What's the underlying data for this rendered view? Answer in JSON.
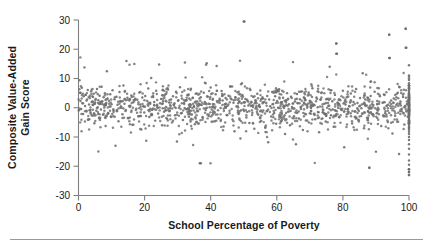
{
  "figure": {
    "background_color": "#ffffff",
    "axis_color": "#808080",
    "text_color": "#1a1a1a",
    "point_color": "#6e6e6e"
  },
  "axes": {
    "ylabel_line1": "Composite Value-Added",
    "ylabel_line2": "Gain Score",
    "xlabel": "School Percentage of Poverty",
    "yticks": [
      "30",
      "20",
      "10",
      "0",
      "-10",
      "-20",
      "-30"
    ],
    "xticks": [
      "0",
      "20",
      "40",
      "60",
      "80",
      "100"
    ]
  },
  "chart_data": {
    "type": "scatter",
    "title": "",
    "xlabel": "School Percentage of Poverty",
    "ylabel": "Composite Value-Added Gain Score",
    "xlim": [
      0,
      100
    ],
    "ylim": [
      -30,
      30
    ],
    "xticks": [
      0,
      20,
      40,
      60,
      80,
      100
    ],
    "yticks": [
      -30,
      -20,
      -10,
      0,
      10,
      20,
      30
    ],
    "grid": false,
    "legend": null,
    "marker": "circle",
    "marker_color": "#6e6e6e",
    "marker_size": 2,
    "n_points": 1400,
    "notable_outliers": [
      {
        "x": 50,
        "y": 29.5
      },
      {
        "x": 99,
        "y": 27
      },
      {
        "x": 94,
        "y": 25
      },
      {
        "x": 78,
        "y": 22
      },
      {
        "x": 99,
        "y": 20.5
      },
      {
        "x": 78,
        "y": 18.5
      },
      {
        "x": 94,
        "y": 17
      },
      {
        "x": 37,
        "y": -19
      },
      {
        "x": 88,
        "y": -20.5
      },
      {
        "x": 100,
        "y": -21
      },
      {
        "x": 100,
        "y": -23
      },
      {
        "x": 100,
        "y": -22
      }
    ],
    "points": [
      [
        0.3,
        9.4
      ],
      [
        0.5,
        5.1
      ],
      [
        0.6,
        2.3
      ],
      [
        0.8,
        -0.4
      ],
      [
        1.0,
        6.8
      ],
      [
        1.2,
        1.5
      ],
      [
        1.4,
        -2.1
      ],
      [
        1.6,
        3.9
      ],
      [
        1.8,
        13.8
      ],
      [
        2.0,
        0.6
      ],
      [
        2.2,
        4.4
      ],
      [
        2.4,
        -1.3
      ],
      [
        2.6,
        2.8
      ],
      [
        2.8,
        6.1
      ],
      [
        3.0,
        -4.0
      ],
      [
        3.2,
        1.1
      ],
      [
        3.4,
        3.3
      ],
      [
        3.6,
        -0.8
      ],
      [
        3.8,
        5.6
      ],
      [
        4.0,
        2.0
      ],
      [
        4.2,
        -2.7
      ],
      [
        4.4,
        0.9
      ],
      [
        4.6,
        4.8
      ],
      [
        4.8,
        -5.3
      ],
      [
        5.0,
        1.8
      ],
      [
        5.2,
        3.0
      ],
      [
        5.4,
        -1.0
      ],
      [
        5.6,
        6.4
      ],
      [
        5.8,
        0.2
      ],
      [
        6.0,
        2.6
      ],
      [
        6.2,
        -3.4
      ],
      [
        6.4,
        4.1
      ],
      [
        6.6,
        1.3
      ],
      [
        6.8,
        -0.6
      ],
      [
        7.0,
        7.2
      ],
      [
        7.2,
        2.2
      ],
      [
        7.4,
        -2.4
      ],
      [
        7.6,
        3.6
      ],
      [
        7.8,
        0.1
      ],
      [
        8.0,
        5.0
      ],
      [
        8.2,
        -6.2
      ],
      [
        8.4,
        1.6
      ],
      [
        8.6,
        12.5
      ],
      [
        8.8,
        3.2
      ],
      [
        9.0,
        -1.8
      ],
      [
        9.2,
        2.4
      ],
      [
        9.4,
        0.4
      ],
      [
        9.6,
        4.6
      ],
      [
        9.8,
        -3.0
      ],
      [
        10.0,
        1.2
      ],
      [
        10.3,
        6.0
      ],
      [
        10.6,
        -0.9
      ],
      [
        10.9,
        2.9
      ],
      [
        11.2,
        -13.0
      ],
      [
        11.5,
        3.8
      ],
      [
        11.8,
        1.0
      ],
      [
        12.1,
        -4.6
      ],
      [
        12.4,
        5.4
      ],
      [
        12.7,
        0.0
      ],
      [
        13.0,
        2.1
      ],
      [
        13.3,
        -2.2
      ],
      [
        13.6,
        7.6
      ],
      [
        13.9,
        1.4
      ],
      [
        14.2,
        -1.1
      ],
      [
        14.5,
        16.0
      ],
      [
        14.8,
        3.4
      ],
      [
        15.1,
        -3.6
      ],
      [
        15.4,
        2.5
      ],
      [
        15.7,
        0.7
      ],
      [
        16.0,
        4.2
      ],
      [
        16.3,
        -5.8
      ],
      [
        16.6,
        1.9
      ],
      [
        16.9,
        15.0
      ],
      [
        17.2,
        3.1
      ],
      [
        17.5,
        -0.3
      ],
      [
        17.8,
        2.7
      ],
      [
        18.1,
        -2.9
      ],
      [
        18.4,
        5.2
      ],
      [
        18.7,
        1.1
      ],
      [
        19.0,
        -7.4
      ],
      [
        19.3,
        3.5
      ],
      [
        19.6,
        0.5
      ],
      [
        19.9,
        -1.6
      ],
      [
        20.2,
        4.0
      ],
      [
        20.5,
        -11.3
      ],
      [
        20.8,
        2.3
      ],
      [
        21.1,
        6.6
      ],
      [
        21.4,
        -3.2
      ],
      [
        21.7,
        1.7
      ],
      [
        22.0,
        10.2
      ],
      [
        22.3,
        -0.7
      ],
      [
        22.6,
        3.7
      ],
      [
        22.9,
        2.0
      ],
      [
        23.2,
        -4.4
      ],
      [
        23.5,
        5.8
      ],
      [
        23.8,
        0.8
      ],
      [
        24.1,
        -2.0
      ],
      [
        24.4,
        14.8
      ],
      [
        24.7,
        1.5
      ],
      [
        25.0,
        3.0
      ],
      [
        25.3,
        -6.0
      ],
      [
        25.6,
        2.2
      ],
      [
        25.9,
        -1.4
      ],
      [
        26.2,
        4.5
      ],
      [
        26.5,
        0.3
      ],
      [
        26.8,
        -3.8
      ],
      [
        27.1,
        6.2
      ],
      [
        27.4,
        1.8
      ],
      [
        27.7,
        -0.2
      ],
      [
        28.0,
        2.8
      ],
      [
        28.3,
        -5.0
      ],
      [
        28.6,
        3.9
      ],
      [
        28.9,
        1.0
      ],
      [
        29.2,
        -2.6
      ],
      [
        29.5,
        5.5
      ],
      [
        29.8,
        -11.5
      ],
      [
        30.1,
        2.4
      ],
      [
        30.4,
        0.0
      ],
      [
        30.7,
        7.0
      ],
      [
        31.0,
        -1.9
      ],
      [
        31.3,
        3.2
      ],
      [
        31.6,
        -4.2
      ],
      [
        31.9,
        1.6
      ],
      [
        32.2,
        15.5
      ],
      [
        32.5,
        2.6
      ],
      [
        32.8,
        -0.5
      ],
      [
        33.1,
        4.3
      ],
      [
        33.4,
        -3.1
      ],
      [
        33.7,
        1.2
      ],
      [
        34.0,
        6.5
      ],
      [
        34.3,
        -2.3
      ],
      [
        34.6,
        3.4
      ],
      [
        34.9,
        0.6
      ],
      [
        35.2,
        -5.6
      ],
      [
        35.5,
        2.1
      ],
      [
        35.8,
        4.9
      ],
      [
        36.1,
        -1.2
      ],
      [
        36.4,
        1.4
      ],
      [
        36.7,
        -19.0
      ],
      [
        37.0,
        3.6
      ],
      [
        37.3,
        0.9
      ],
      [
        37.6,
        -3.4
      ],
      [
        37.9,
        5.1
      ],
      [
        38.2,
        2.0
      ],
      [
        38.5,
        -0.8
      ],
      [
        38.8,
        15.2
      ],
      [
        39.1,
        3.8
      ],
      [
        39.4,
        -2.8
      ],
      [
        39.7,
        1.3
      ],
      [
        40.0,
        6.9
      ],
      [
        40.3,
        -4.8
      ],
      [
        40.6,
        2.7
      ],
      [
        40.9,
        0.2
      ],
      [
        41.2,
        -1.5
      ],
      [
        41.5,
        4.6
      ],
      [
        41.8,
        14.3
      ],
      [
        42.1,
        1.9
      ],
      [
        42.4,
        -3.6
      ],
      [
        42.7,
        3.1
      ],
      [
        43.0,
        -0.1
      ],
      [
        43.3,
        5.7
      ],
      [
        43.6,
        2.5
      ],
      [
        43.9,
        -6.4
      ],
      [
        44.2,
        1.1
      ],
      [
        44.5,
        3.3
      ],
      [
        44.8,
        -2.5
      ],
      [
        45.1,
        0.7
      ],
      [
        45.4,
        4.1
      ],
      [
        45.7,
        -1.0
      ],
      [
        46.0,
        7.3
      ],
      [
        46.3,
        2.9
      ],
      [
        46.6,
        -4.0
      ],
      [
        46.9,
        1.7
      ],
      [
        47.2,
        -8.0
      ],
      [
        47.5,
        3.5
      ],
      [
        47.8,
        0.4
      ],
      [
        48.1,
        5.3
      ],
      [
        48.4,
        -2.1
      ],
      [
        48.7,
        2.2
      ],
      [
        49.0,
        -10.5
      ],
      [
        49.3,
        1.5
      ],
      [
        49.6,
        4.4
      ],
      [
        49.9,
        -0.6
      ],
      [
        50.2,
        29.5
      ],
      [
        50.5,
        3.0
      ],
      [
        50.8,
        -3.3
      ],
      [
        51.1,
        2.4
      ],
      [
        51.4,
        0.8
      ],
      [
        51.7,
        -5.2
      ],
      [
        52.0,
        6.1
      ],
      [
        52.3,
        1.8
      ],
      [
        52.6,
        -1.7
      ],
      [
        52.9,
        3.7
      ],
      [
        53.2,
        -7.2
      ],
      [
        53.5,
        2.6
      ],
      [
        53.8,
        0.1
      ],
      [
        54.1,
        4.8
      ],
      [
        54.4,
        -2.4
      ],
      [
        54.7,
        1.0
      ],
      [
        55.0,
        5.9
      ],
      [
        55.3,
        -4.5
      ],
      [
        55.6,
        3.2
      ],
      [
        55.9,
        -0.9
      ],
      [
        56.2,
        2.0
      ],
      [
        56.5,
        -6.8
      ],
      [
        56.8,
        1.6
      ],
      [
        57.1,
        4.0
      ],
      [
        57.4,
        -11.8
      ],
      [
        57.7,
        2.8
      ],
      [
        58.0,
        0.5
      ],
      [
        58.3,
        -3.0
      ],
      [
        58.6,
        5.4
      ],
      [
        58.9,
        1.3
      ],
      [
        59.2,
        -1.8
      ],
      [
        59.5,
        3.9
      ],
      [
        59.8,
        -5.5
      ],
      [
        60.1,
        2.3
      ],
      [
        60.4,
        0.0
      ],
      [
        60.7,
        6.3
      ],
      [
        61.0,
        -2.7
      ],
      [
        61.3,
        1.9
      ],
      [
        61.6,
        -4.1
      ],
      [
        61.9,
        3.4
      ],
      [
        62.2,
        0.6
      ],
      [
        62.5,
        -9.0
      ],
      [
        62.8,
        2.5
      ],
      [
        63.1,
        5.0
      ],
      [
        63.4,
        -1.4
      ],
      [
        63.7,
        1.2
      ],
      [
        64.0,
        -6.0
      ],
      [
        64.3,
        3.8
      ],
      [
        64.6,
        0.3
      ],
      [
        64.9,
        15.6
      ],
      [
        65.2,
        -2.9
      ],
      [
        65.5,
        2.1
      ],
      [
        65.8,
        -12.5
      ],
      [
        66.1,
        4.7
      ],
      [
        66.4,
        1.5
      ],
      [
        66.7,
        -3.7
      ],
      [
        67.0,
        2.9
      ],
      [
        67.3,
        -0.4
      ],
      [
        67.6,
        5.6
      ],
      [
        67.9,
        -7.6
      ],
      [
        68.2,
        1.7
      ],
      [
        68.5,
        3.1
      ],
      [
        68.8,
        -2.2
      ],
      [
        69.1,
        0.9
      ],
      [
        69.4,
        4.2
      ],
      [
        69.7,
        -5.0
      ],
      [
        70.0,
        2.4
      ],
      [
        70.4,
        -1.1
      ],
      [
        70.8,
        6.7
      ],
      [
        71.2,
        1.0
      ],
      [
        71.6,
        -3.9
      ],
      [
        72.0,
        3.5
      ],
      [
        72.4,
        0.2
      ],
      [
        72.8,
        -8.4
      ],
      [
        73.2,
        2.7
      ],
      [
        73.6,
        5.2
      ],
      [
        74.0,
        -1.6
      ],
      [
        74.4,
        1.4
      ],
      [
        74.8,
        -4.7
      ],
      [
        75.2,
        3.0
      ],
      [
        75.6,
        0.7
      ],
      [
        76.0,
        14.0
      ],
      [
        76.4,
        -2.6
      ],
      [
        76.8,
        2.2
      ],
      [
        77.2,
        -6.5
      ],
      [
        77.6,
        4.4
      ],
      [
        78.0,
        22.0
      ],
      [
        78.2,
        18.5
      ],
      [
        78.4,
        1.8
      ],
      [
        78.8,
        -3.2
      ],
      [
        79.2,
        2.6
      ],
      [
        79.6,
        -0.7
      ],
      [
        80.0,
        5.8
      ],
      [
        80.4,
        -13.5
      ],
      [
        80.8,
        1.1
      ],
      [
        81.2,
        3.6
      ],
      [
        81.6,
        -2.0
      ],
      [
        82.0,
        0.4
      ],
      [
        82.4,
        4.9
      ],
      [
        82.8,
        -5.4
      ],
      [
        83.2,
        2.0
      ],
      [
        83.6,
        -1.3
      ],
      [
        84.0,
        6.4
      ],
      [
        84.4,
        1.6
      ],
      [
        84.8,
        -4.3
      ],
      [
        85.2,
        3.3
      ],
      [
        85.6,
        -0.2
      ],
      [
        86.0,
        11.8
      ],
      [
        86.4,
        -7.0
      ],
      [
        86.8,
        2.8
      ],
      [
        87.2,
        0.8
      ],
      [
        87.6,
        -3.5
      ],
      [
        88.0,
        -20.5
      ],
      [
        88.4,
        4.0
      ],
      [
        88.8,
        1.2
      ],
      [
        89.2,
        -2.3
      ],
      [
        89.6,
        5.5
      ],
      [
        90.0,
        -15.0
      ],
      [
        90.4,
        2.3
      ],
      [
        90.8,
        -0.5
      ],
      [
        91.2,
        3.9
      ],
      [
        91.6,
        -6.2
      ],
      [
        92.0,
        1.7
      ],
      [
        92.4,
        4.5
      ],
      [
        92.8,
        -1.9
      ],
      [
        93.2,
        0.6
      ],
      [
        93.6,
        -4.9
      ],
      [
        94.0,
        25.0
      ],
      [
        94.2,
        17.0
      ],
      [
        94.6,
        2.5
      ],
      [
        95.0,
        -8.8
      ],
      [
        95.4,
        3.2
      ],
      [
        95.8,
        -2.7
      ],
      [
        96.2,
        1.0
      ],
      [
        96.6,
        5.1
      ],
      [
        97.0,
        -15.8
      ],
      [
        97.4,
        2.1
      ],
      [
        97.8,
        -1.2
      ],
      [
        98.2,
        3.7
      ],
      [
        98.6,
        -5.7
      ],
      [
        99.0,
        27.0
      ],
      [
        99.2,
        20.5
      ],
      [
        99.4,
        1.3
      ],
      [
        99.6,
        -3.1
      ],
      [
        99.8,
        2.4
      ],
      [
        100,
        14.5
      ],
      [
        100,
        11.0
      ],
      [
        100,
        9.5
      ],
      [
        100,
        8.4
      ],
      [
        100,
        7.6
      ],
      [
        100,
        7.0
      ],
      [
        100,
        6.4
      ],
      [
        100,
        5.9
      ],
      [
        100,
        5.4
      ],
      [
        100,
        5.0
      ],
      [
        100,
        4.6
      ],
      [
        100,
        4.2
      ],
      [
        100,
        3.9
      ],
      [
        100,
        3.6
      ],
      [
        100,
        3.3
      ],
      [
        100,
        3.0
      ],
      [
        100,
        2.7
      ],
      [
        100,
        2.4
      ],
      [
        100,
        2.1
      ],
      [
        100,
        1.8
      ],
      [
        100,
        1.5
      ],
      [
        100,
        1.2
      ],
      [
        100,
        0.9
      ],
      [
        100,
        0.6
      ],
      [
        100,
        0.3
      ],
      [
        100,
        0.0
      ],
      [
        100,
        -0.3
      ],
      [
        100,
        -0.6
      ],
      [
        100,
        -0.9
      ],
      [
        100,
        -1.2
      ],
      [
        100,
        -1.5
      ],
      [
        100,
        -1.8
      ],
      [
        100,
        -2.1
      ],
      [
        100,
        -2.4
      ],
      [
        100,
        -2.7
      ],
      [
        100,
        -3.0
      ],
      [
        100,
        -3.4
      ],
      [
        100,
        -3.8
      ],
      [
        100,
        -4.2
      ],
      [
        100,
        -4.6
      ],
      [
        100,
        -5.1
      ],
      [
        100,
        -5.6
      ],
      [
        100,
        -6.2
      ],
      [
        100,
        -6.8
      ],
      [
        100,
        -7.5
      ],
      [
        100,
        -8.2
      ],
      [
        100,
        -9.0
      ],
      [
        100,
        -10.0
      ],
      [
        100,
        -11.0
      ],
      [
        100,
        -12.5
      ],
      [
        100,
        -14.0
      ],
      [
        100,
        -16.0
      ],
      [
        100,
        -18.0
      ],
      [
        100,
        -19.5
      ],
      [
        100,
        -21.0
      ],
      [
        100,
        -22.0
      ],
      [
        100,
        -23.0
      ]
    ]
  }
}
